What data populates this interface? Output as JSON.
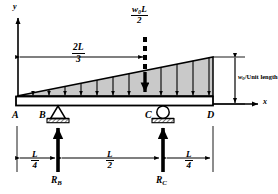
{
  "diagram": {
    "type": "free-body-diagram",
    "axes": {
      "y_label": "y",
      "x_label": "x"
    },
    "points": {
      "a": "A",
      "b": "B",
      "c": "C",
      "d": "D"
    },
    "resultant_load": {
      "numerator": "w₀L",
      "denominator": "2",
      "position_label": {
        "numerator": "2L",
        "denominator": "3"
      }
    },
    "load_intensity": {
      "symbol": "w",
      "subscript": "0",
      "text": "/Unit length"
    },
    "reactions": {
      "b": {
        "symbol": "R",
        "subscript": "B"
      },
      "c": {
        "symbol": "R",
        "subscript": "C"
      }
    },
    "dimensions": [
      {
        "numerator": "L",
        "denominator": "4",
        "span": "A-B"
      },
      {
        "numerator": "L",
        "denominator": "2",
        "span": "B-C"
      },
      {
        "numerator": "L",
        "denominator": "4",
        "span": "C-D"
      }
    ],
    "supports": {
      "b_type": "pin-support-triangle",
      "c_type": "roller-support-circle"
    },
    "colors": {
      "ink": "#000000",
      "load_fill": "#c9c9c9",
      "background": "#ffffff"
    }
  }
}
